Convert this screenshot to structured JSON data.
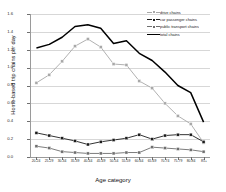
{
  "chart_data": {
    "type": "line",
    "title": "",
    "xlabel": "Age category",
    "ylabel": "Home-based trip chains per day",
    "categories": [
      "20-24",
      "25-29",
      "30-34",
      "35-39",
      "40-44",
      "45-49",
      "50-54",
      "55-59",
      "60-64",
      "65-69",
      "70-74",
      "75-79",
      "80-84",
      "85+"
    ],
    "ylim": [
      0.0,
      1.6
    ],
    "yticks": [
      "0.0",
      "0.2",
      "0.4",
      "0.6",
      "0.8",
      "1.0",
      "1.2",
      "1.4",
      "1.6"
    ],
    "grid": true,
    "legend_position": "top-right",
    "series": [
      {
        "name": "drive chains",
        "color": "#a8a8a8",
        "marker": "square",
        "values": [
          0.83,
          0.92,
          1.07,
          1.24,
          1.32,
          1.23,
          1.04,
          1.03,
          0.85,
          0.77,
          0.6,
          0.46,
          0.37,
          0.16
        ]
      },
      {
        "name": "car passenger chains",
        "color": "#1c1c1c",
        "marker": "square",
        "values": [
          0.27,
          0.24,
          0.21,
          0.18,
          0.14,
          0.17,
          0.19,
          0.21,
          0.25,
          0.2,
          0.24,
          0.25,
          0.25,
          0.17
        ]
      },
      {
        "name": "public transport chains",
        "color": "#6e6e6e",
        "marker": "square",
        "values": [
          0.12,
          0.1,
          0.06,
          0.05,
          0.04,
          0.04,
          0.04,
          0.05,
          0.05,
          0.11,
          0.1,
          0.09,
          0.08,
          0.06
        ]
      },
      {
        "name": "total chains",
        "color": "#000000",
        "marker": "none",
        "values": [
          1.22,
          1.26,
          1.34,
          1.46,
          1.48,
          1.44,
          1.27,
          1.3,
          1.16,
          1.08,
          0.95,
          0.8,
          0.72,
          0.39
        ]
      }
    ]
  }
}
